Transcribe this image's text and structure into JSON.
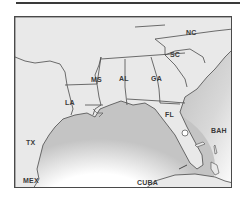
{
  "map": {
    "title": "Southeastern United States",
    "colors": {
      "land": "#e9e9e9",
      "water": "#ffffff",
      "water_shade": "#bdbdbd",
      "border": "#4a4a4a",
      "label": "#3a3a3a"
    },
    "state_labels": {
      "tx": "TX",
      "la": "LA",
      "ms": "MS",
      "al": "AL",
      "ga": "GA",
      "sc": "SC",
      "nc": "NC",
      "fl": "FL"
    },
    "neighbor_labels": {
      "mex": "MEX",
      "cuba": "CUBA",
      "bah": "BAH"
    }
  }
}
